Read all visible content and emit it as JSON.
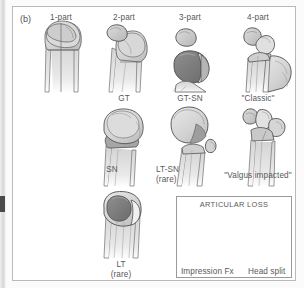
{
  "figure": {
    "panel_tag": "(b)",
    "title_implied": "Neer classification of proximal humerus fractures",
    "background_color": "#ffffff",
    "border_color": "#b9b9b9",
    "label_color": "#58585a"
  },
  "columns": [
    {
      "id": "col-1-part",
      "label": "1-part"
    },
    {
      "id": "col-2-part",
      "label": "2-part"
    },
    {
      "id": "col-3-part",
      "label": "3-part"
    },
    {
      "id": "col-4-part",
      "label": "4-part"
    }
  ],
  "labels": {
    "gt": "GT",
    "gt_sn": "GT-SN",
    "classic": "\"Classic\"",
    "sn": "SN",
    "lt_sn": "LT-SN",
    "lt_sn_rare": "(rare)",
    "valgus_impacted": "\"Valgus impacted\"",
    "lt": "LT",
    "lt_rare": "(rare)"
  },
  "articular_loss_box": {
    "title": "ARTICULAR LOSS",
    "items": [
      {
        "id": "impression-fx",
        "label": "Impression Fx"
      },
      {
        "id": "head-split",
        "label": "Head split"
      }
    ]
  },
  "palette": {
    "bone_light": "#e3e3e3",
    "bone_mid": "#cfcfcf",
    "bone_shade": "#b4b4b4",
    "fragment_dark": "#8d8d8d",
    "fragment_darker": "#6e6e6e",
    "outline": "#4a4a4a",
    "white": "#f7f7f7"
  }
}
